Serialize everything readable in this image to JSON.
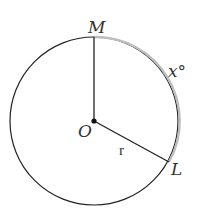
{
  "diagram": {
    "points": {
      "M": "M",
      "O": "O",
      "L": "L"
    },
    "radius_label": "r",
    "arc_label": "x°",
    "colors": {
      "circle": "#222222",
      "arc_highlight": "#bdbdbd",
      "radius": "#222222"
    }
  }
}
